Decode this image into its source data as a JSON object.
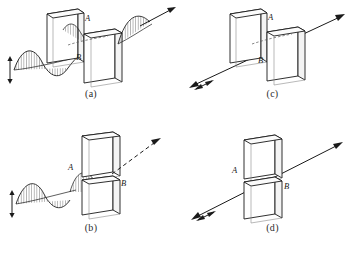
{
  "figure": {
    "stroke_color": "#1a1a1a",
    "plate_face_color": "#ffffff",
    "plate_edge_color": "#6f6f6f",
    "wave_hatch_color": "#3a3a3a"
  },
  "panels": [
    {
      "id": "a",
      "caption": "(a)",
      "polarizer_labels": {
        "first": "A",
        "second": "B"
      },
      "arrangement": "side-by-side",
      "incoming_wave": "hatched-sine",
      "incoming_polarization_marker": "vertical-double-arrow",
      "outgoing_wave": "hatched-sine",
      "outgoing_ray": "solid-arrow",
      "transmitted": "yes"
    },
    {
      "id": "b",
      "caption": "(b)",
      "polarizer_labels": {
        "first": "A",
        "second": "B"
      },
      "arrangement": "stacked",
      "incoming_wave": "hatched-sine",
      "incoming_polarization_marker": "vertical-double-arrow",
      "outgoing_wave": "none",
      "outgoing_ray": "dashed-arrow",
      "transmitted": "no"
    },
    {
      "id": "c",
      "caption": "(c)",
      "polarizer_labels": {
        "first": "A",
        "second": "B"
      },
      "arrangement": "side-by-side",
      "incoming_wave": "none",
      "incoming_polarization_marker": "double-arrow-on-ray",
      "outgoing_wave": "none",
      "outgoing_ray": "solid-arrow",
      "transmitted": "yes"
    },
    {
      "id": "d",
      "caption": "(d)",
      "polarizer_labels": {
        "first": "A",
        "second": "B"
      },
      "arrangement": "stacked",
      "incoming_wave": "none",
      "incoming_polarization_marker": "double-arrow-on-ray",
      "outgoing_wave": "none",
      "outgoing_ray": "solid-arrow",
      "transmitted": "yes"
    }
  ]
}
